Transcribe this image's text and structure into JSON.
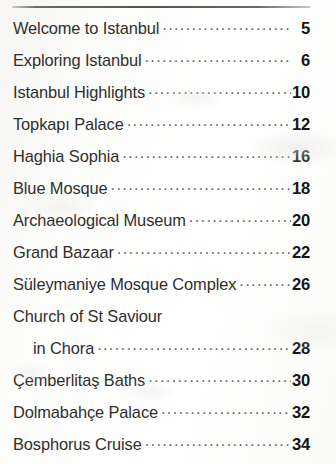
{
  "document": {
    "type": "table-of-contents",
    "has_top_rule": true,
    "entries": [
      {
        "title": "Welcome to Istanbul",
        "page": "5",
        "indented": false,
        "leader": true
      },
      {
        "title": "Exploring Istanbul",
        "page": "6",
        "indented": false,
        "leader": true
      },
      {
        "title": "Istanbul Highlights",
        "page": "10",
        "indented": false,
        "leader": true
      },
      {
        "title": "Topkapı Palace",
        "page": "12",
        "indented": false,
        "leader": true
      },
      {
        "title": "Haghia Sophia",
        "page": "16",
        "indented": false,
        "leader": true
      },
      {
        "title": "Blue Mosque",
        "page": "18",
        "indented": false,
        "leader": true
      },
      {
        "title": "Archaeological Museum",
        "page": "20",
        "indented": false,
        "leader": true
      },
      {
        "title": "Grand Bazaar",
        "page": "22",
        "indented": false,
        "leader": true
      },
      {
        "title": "Süleymaniye Mosque Complex",
        "page": "26",
        "indented": false,
        "leader": true
      },
      {
        "title": "Church of St Saviour",
        "page": "",
        "indented": false,
        "leader": false
      },
      {
        "title": "in Chora",
        "page": "28",
        "indented": true,
        "leader": true
      },
      {
        "title": "Çemberlitaş Baths",
        "page": "30",
        "indented": false,
        "leader": true
      },
      {
        "title": "Dolmabahçe Palace",
        "page": "32",
        "indented": false,
        "leader": true
      },
      {
        "title": "Bosphorus Cruise",
        "page": "34",
        "indented": false,
        "leader": true
      }
    ]
  },
  "colors": {
    "page_background": "#fdfdfc",
    "title_text": "#2f2e2d",
    "page_number_text": "#161616",
    "leader_dots": "#6a6866",
    "top_rule": "#56544f"
  }
}
